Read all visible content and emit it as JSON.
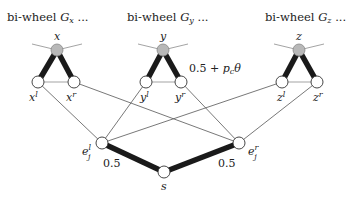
{
  "headers": {
    "gx": {
      "prefix": "bi-wheel ",
      "graph": "G",
      "sub": "x",
      "suffix": " ..."
    },
    "gy": {
      "prefix": "bi-wheel ",
      "graph": "G",
      "sub": "y",
      "suffix": " ..."
    },
    "gz": {
      "prefix": "bi-wheel ",
      "graph": "G",
      "sub": "z",
      "suffix": " ..."
    }
  },
  "nodes": {
    "x": {
      "label": "x",
      "type": "hub"
    },
    "xl": {
      "label": "x",
      "sup": "l",
      "type": "open"
    },
    "xr": {
      "label": "x",
      "sup": "r",
      "type": "open"
    },
    "y": {
      "label": "y",
      "type": "hub"
    },
    "yl": {
      "label": "y",
      "sup": "l",
      "type": "open"
    },
    "yr": {
      "label": "y",
      "sup": "r",
      "type": "open"
    },
    "z": {
      "label": "z",
      "type": "hub"
    },
    "zl": {
      "label": "z",
      "sup": "l",
      "type": "open"
    },
    "zr": {
      "label": "z",
      "sup": "r",
      "type": "open"
    },
    "ejl": {
      "label": "e",
      "sub": "j",
      "sup": "l",
      "type": "open"
    },
    "ejr": {
      "label": "e",
      "sub": "j",
      "sup": "r",
      "type": "open"
    },
    "s": {
      "label": "s",
      "type": "open"
    }
  },
  "edges": [
    {
      "from": "x",
      "to": "xl",
      "style": "thick"
    },
    {
      "from": "x",
      "to": "xr",
      "style": "thick"
    },
    {
      "from": "xl",
      "to": "xr",
      "style": "gray"
    },
    {
      "from": "y",
      "to": "yl",
      "style": "thick"
    },
    {
      "from": "y",
      "to": "yr",
      "style": "thick"
    },
    {
      "from": "yl",
      "to": "yr",
      "style": "gray"
    },
    {
      "from": "z",
      "to": "zl",
      "style": "thick"
    },
    {
      "from": "z",
      "to": "zr",
      "style": "thick"
    },
    {
      "from": "zl",
      "to": "zr",
      "style": "gray"
    },
    {
      "from": "xl",
      "to": "ejl",
      "style": "thin"
    },
    {
      "from": "yl",
      "to": "ejl",
      "style": "thin"
    },
    {
      "from": "zl",
      "to": "ejl",
      "style": "thin"
    },
    {
      "from": "xr",
      "to": "ejr",
      "style": "thin"
    },
    {
      "from": "yr",
      "to": "ejr",
      "style": "thin"
    },
    {
      "from": "zr",
      "to": "ejr",
      "style": "thin"
    },
    {
      "from": "ejl",
      "to": "s",
      "style": "thick",
      "weight": "0.5"
    },
    {
      "from": "s",
      "to": "ejr",
      "style": "thick",
      "weight": "0.5"
    }
  ],
  "annotations": {
    "y_triangle_weight": {
      "prefix": "0.5 + ",
      "p": "p",
      "p_sub": "c",
      "theta": "θ"
    },
    "left_weight": "0.5",
    "right_weight": "0.5"
  }
}
